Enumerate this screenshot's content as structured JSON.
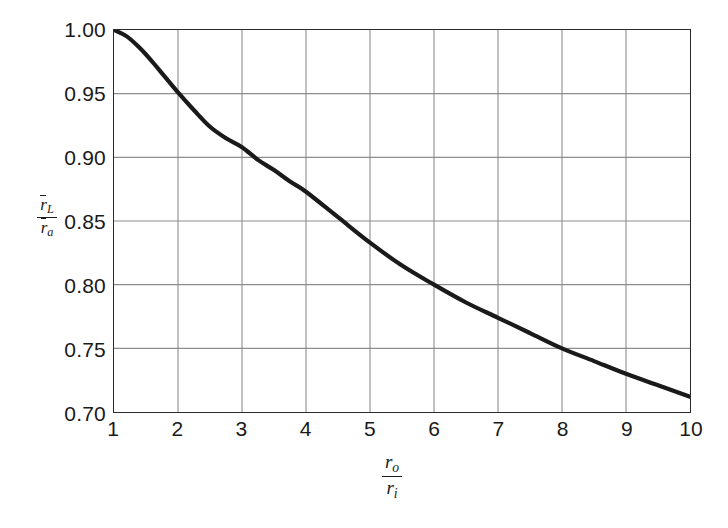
{
  "figure": {
    "background_color": "#ffffff",
    "axis_color": "#2b2b2b",
    "grid_color": "#8d8d8d",
    "curve_color": "#1a1a1a"
  },
  "axes": {
    "y_ticks": [
      "1.00",
      "0.95",
      "0.90",
      "0.85",
      "0.80",
      "0.75",
      "0.70"
    ],
    "x_ticks": [
      "1",
      "2",
      "3",
      "4",
      "5",
      "6",
      "7",
      "8",
      "9",
      "10"
    ],
    "y_title": {
      "numerator_symbol": "r",
      "numerator_subscript": "L",
      "denominator_symbol": "r",
      "denominator_subscript": "a"
    },
    "x_title": {
      "numerator_symbol": "r",
      "numerator_subscript": "o",
      "denominator_symbol": "r",
      "denominator_subscript": "i"
    }
  },
  "chart_data": {
    "type": "line",
    "title": "",
    "subtitle": "",
    "xlabel": "r_o / r_i",
    "ylabel": "r̄_L / r̄_a",
    "xlim": [
      1,
      10
    ],
    "ylim": [
      0.7,
      1.0
    ],
    "xticks": [
      1,
      2,
      3,
      4,
      5,
      6,
      7,
      8,
      9,
      10
    ],
    "yticks": [
      0.7,
      0.75,
      0.8,
      0.85,
      0.9,
      0.95,
      1.0
    ],
    "grid": true,
    "legend": null,
    "legend_position": "none",
    "annotations": [],
    "series": [
      {
        "name": "rL/ra vs ro/ri",
        "x": [
          1.0,
          1.2,
          1.4,
          1.6,
          1.8,
          2.0,
          2.25,
          2.5,
          2.75,
          3.0,
          3.25,
          3.5,
          3.75,
          4.0,
          4.5,
          5.0,
          5.5,
          6.0,
          6.5,
          7.0,
          7.5,
          8.0,
          8.5,
          9.0,
          9.5,
          10.0
        ],
        "y": [
          1.0,
          0.995,
          0.986,
          0.975,
          0.963,
          0.951,
          0.937,
          0.924,
          0.915,
          0.908,
          0.898,
          0.89,
          0.881,
          0.873,
          0.853,
          0.833,
          0.815,
          0.8,
          0.786,
          0.774,
          0.762,
          0.75,
          0.74,
          0.73,
          0.721,
          0.712
        ]
      }
    ]
  }
}
